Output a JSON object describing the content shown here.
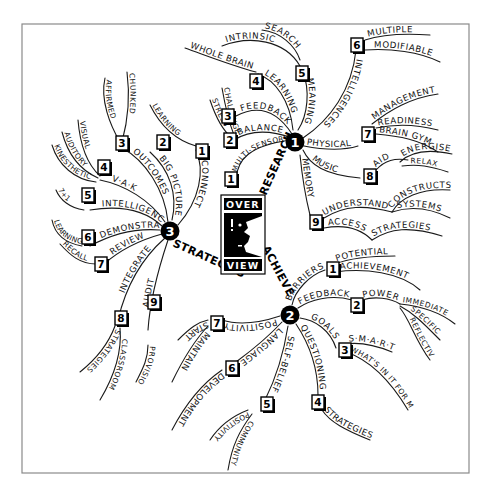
{
  "center": {
    "top": "OVER",
    "bottom": "VIEW",
    "icon": "thinking-head-icon"
  },
  "colors": {
    "ink": "#111111",
    "frame": "#8a8a8a",
    "paper": "#ffffff"
  },
  "hubs": {
    "research": {
      "number": "1",
      "label": "RESEARCH",
      "branches": [
        {
          "number": "1",
          "label": "MULTI-SENSORY"
        },
        {
          "number": "2",
          "label": "BALANCE",
          "subs": [
            "STRESS",
            "CHALLENGE"
          ]
        },
        {
          "number": "3",
          "label": "FEEDBACK"
        },
        {
          "number": "4",
          "label": "LEARNING",
          "subs": [
            "WHOLE BRAIN"
          ]
        },
        {
          "number": "5",
          "label": "MEANING",
          "subs": [
            "INTRINSIC",
            "SEARCH"
          ]
        },
        {
          "number": "6",
          "label": "INTELLIGENCES",
          "subs": [
            "MULTIPLE",
            "MODIFIABLE"
          ]
        },
        {
          "number": "7",
          "label": "PHYSICAL",
          "subs": [
            "MANAGEMENT",
            "READINESS",
            "BRAIN GYM"
          ]
        },
        {
          "number": "8",
          "label": "MUSIC",
          "subs": [
            "AID",
            "ENERGISE",
            "RELAX"
          ]
        },
        {
          "number": "9",
          "label": "MEMORY",
          "subs": [
            "UNDERSTAND",
            "CONSTRUCTS",
            "SYSTEMS",
            "ACCESS",
            "STRATEGIES"
          ]
        }
      ]
    },
    "achieve": {
      "number": "2",
      "label": "ACHIEVE",
      "branches": [
        {
          "number": "1",
          "label": "BARRIERS",
          "subs": [
            "POTENTIAL",
            "ACHIEVEMENT"
          ]
        },
        {
          "number": "2",
          "label": "FEEDBACK",
          "subs": [
            "POWER",
            "IMMEDIATE",
            "SPECIFIC",
            "REFLECTIVE"
          ]
        },
        {
          "number": "3",
          "label": "GOALS",
          "subs": [
            "S·M·A·R·T",
            "WHAT'S IN IT FOR ME?"
          ]
        },
        {
          "number": "4",
          "label": "QUESTIONING",
          "subs": [
            "STRATEGIES"
          ]
        },
        {
          "number": "5",
          "label": "SELF-BELIEF",
          "subs": [
            "POSITIVITY",
            "COMMUNITY"
          ]
        },
        {
          "number": "6",
          "label": "LANGUAGE",
          "subs": [
            "DEVELOPMENT"
          ]
        },
        {
          "number": "7",
          "label": "POSITIVITY",
          "subs": [
            "START",
            "MAINTAIN"
          ]
        }
      ]
    },
    "strategies": {
      "number": "3",
      "label": "STRATEGIES",
      "branches": [
        {
          "number": "1",
          "label": "CONNECT",
          "subs": [
            "LEARNING"
          ]
        },
        {
          "number": "2",
          "label": "BIG PICTURE"
        },
        {
          "number": "3",
          "label": "OUTCOMES",
          "subs": [
            "AFFIRMED",
            "CHUNKED"
          ]
        },
        {
          "number": "4",
          "label": "V·A·K",
          "subs": [
            "VISUAL",
            "AUDITORY",
            "KINESTHETIC"
          ]
        },
        {
          "number": "5",
          "label": "INTELLIGENCES",
          "subs": [
            "7+1"
          ]
        },
        {
          "number": "6",
          "label": "DEMONSTRATE",
          "subs": [
            "LEARNING"
          ]
        },
        {
          "number": "7",
          "label": "REVIEW",
          "subs": [
            "RECALL"
          ]
        },
        {
          "number": "8",
          "label": "INTEGRATE",
          "subs": [
            "STRATEGIES",
            "CLASSROOM"
          ]
        },
        {
          "number": "9",
          "label": "AUDIT",
          "subs": [
            "PROVISION"
          ]
        }
      ]
    }
  }
}
